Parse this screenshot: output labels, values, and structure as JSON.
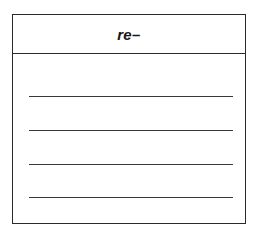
{
  "page": {
    "background_color": "#ffffff",
    "ink_color": "#2b2b2b"
  },
  "worksheet": {
    "name": "lined-answer-box",
    "border_color": "#2b2b2b",
    "fill_color": "#ffffff",
    "header": {
      "title": "re–",
      "style": "bold-italic",
      "align": "center",
      "text_color": "#161616",
      "divider_color": "#2b2b2b"
    },
    "writing_lines": [
      {
        "index": 1,
        "label": ""
      },
      {
        "index": 2,
        "label": ""
      },
      {
        "index": 3,
        "label": ""
      },
      {
        "index": 4,
        "label": ""
      }
    ],
    "line_color": "#383838",
    "line_count": 4
  }
}
